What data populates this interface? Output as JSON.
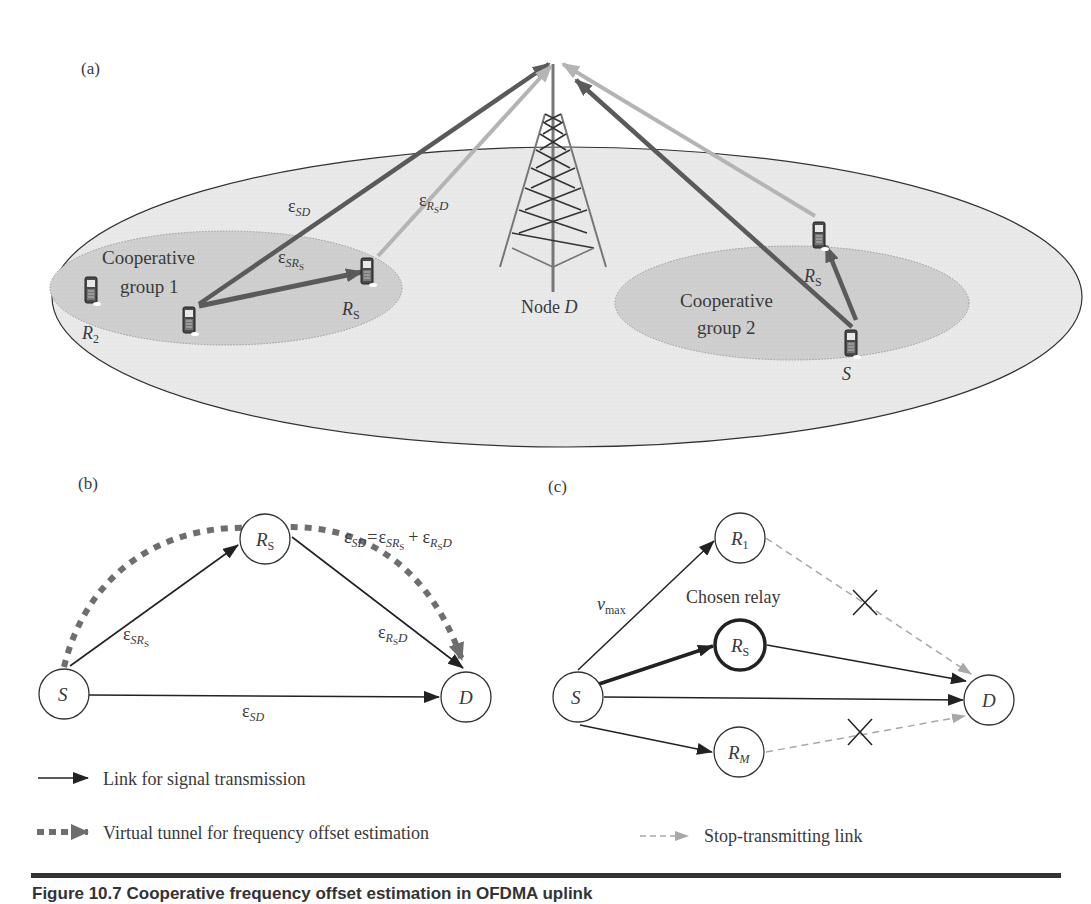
{
  "figure": {
    "caption": "Figure 10.7   Cooperative frequency offset estimation in OFDMA uplink",
    "panels": {
      "a": {
        "label": "(a)",
        "node_d_label_prefix": "Node ",
        "node_d_label_var": "D",
        "group1": {
          "line1": "Cooperative",
          "line2": "group 1"
        },
        "group2": {
          "line1": "Cooperative",
          "line2": "group 2"
        },
        "devices": {
          "r2": {
            "var": "R",
            "sub": "2"
          },
          "rs_left": {
            "var": "R",
            "sub": "S"
          },
          "rs_right": {
            "var": "R",
            "sub": "S"
          },
          "s_right": {
            "var": "S"
          }
        },
        "links": {
          "sd": {
            "eps": "ε",
            "sub": "SD"
          },
          "srs": {
            "eps": "ε",
            "sub": "SR",
            "subsub": "S"
          },
          "rsd": {
            "eps": "ε",
            "sub": "R",
            "subsub": "S",
            "tail": "D"
          }
        }
      },
      "b": {
        "label": "(b)",
        "nodes": {
          "s": "S",
          "rs_var": "R",
          "rs_sub": "S",
          "d": "D"
        },
        "equation": {
          "lhs_eps": "ε",
          "lhs_sub": "SD",
          "eq": "=",
          "t1_eps": "ε",
          "t1_sub": "SR",
          "t1_subsub": "S",
          "plus": "+",
          "t2_eps": "ε",
          "t2_sub": "R",
          "t2_subsub": "S",
          "t2_tail": "D"
        },
        "link_labels": {
          "srs": {
            "eps": "ε",
            "sub": "SR",
            "subsub": "S"
          },
          "rsd": {
            "eps": "ε",
            "sub": "R",
            "subsub": "S",
            "tail": "D"
          },
          "sd": {
            "eps": "ε",
            "sub": "SD"
          }
        },
        "legend": [
          {
            "text": "Link for signal transmission"
          },
          {
            "text": "Virtual tunnel for frequency offset estimation"
          }
        ]
      },
      "c": {
        "label": "(c)",
        "nodes": {
          "s": "S",
          "r1_var": "R",
          "r1_sub": "1",
          "rs_var": "R",
          "rs_sub": "S",
          "rm_var": "R",
          "rm_sub": "M",
          "d": "D"
        },
        "vmax_var": "v",
        "vmax_sub": "max",
        "chosen_relay": "Chosen relay",
        "legend": [
          {
            "text": "Stop-transmitting link"
          }
        ]
      }
    },
    "colors": {
      "dark_link": "#5a5a5a",
      "light_link": "#b4b4b4",
      "tunnel": "#6e6e6e",
      "cell_fill": "#e9e9e9",
      "group_fill": "#cfcfcf",
      "stop_link": "#a8a8a8"
    }
  }
}
